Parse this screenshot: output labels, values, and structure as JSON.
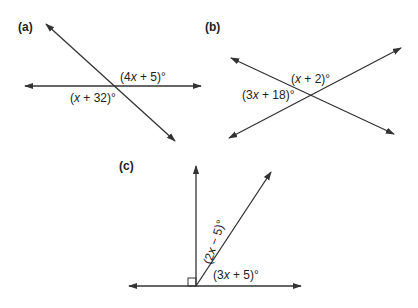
{
  "diagrams": [
    {
      "id": "a",
      "part_label": "(a)",
      "description": "Two intersecting lines forming vertical angles",
      "angles": [
        {
          "label_parts": [
            "(4",
            "x",
            " + 5)°"
          ],
          "text": "(4x + 5)°"
        },
        {
          "label_parts": [
            "(",
            "x",
            " + 32)°"
          ],
          "text": "(x + 32)°"
        }
      ]
    },
    {
      "id": "b",
      "part_label": "(b)",
      "description": "Two intersecting lines forming adjacent angles",
      "angles": [
        {
          "label_parts": [
            "(",
            "x",
            " + 2)°"
          ],
          "text": "(x + 2)°"
        },
        {
          "label_parts": [
            "(3",
            "x",
            " + 18)°"
          ],
          "text": "(3x + 18)°"
        }
      ]
    },
    {
      "id": "c",
      "part_label": "(c)",
      "description": "Right angle with a ray dividing the complementary region",
      "angles": [
        {
          "label_parts": [
            "(2",
            "x",
            " − 5)°"
          ],
          "text": "(2x − 5)°"
        },
        {
          "label_parts": [
            "(3",
            "x",
            " + 5)°"
          ],
          "text": "(3x + 5)°"
        }
      ],
      "right_angle_marker": true
    }
  ],
  "colors": {
    "line": "#333333",
    "text": "#222222",
    "background": "#ffffff"
  }
}
